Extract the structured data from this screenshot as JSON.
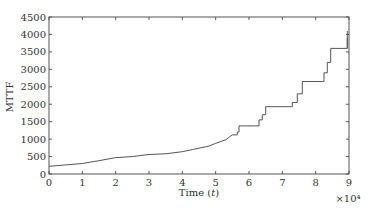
{
  "chart_data": {
    "type": "line",
    "title": "",
    "xlabel": "Time (t)",
    "ylabel": "MTTF",
    "x_multiplier_label": "×10⁴",
    "xlim": [
      0,
      9
    ],
    "ylim": [
      0,
      4500
    ],
    "x_ticks": [
      0,
      1,
      2,
      3,
      4,
      5,
      6,
      7,
      8,
      9
    ],
    "y_ticks": [
      0,
      500,
      1000,
      1500,
      2000,
      2500,
      3000,
      3500,
      4000,
      4500
    ],
    "grid": false,
    "legend": null,
    "line_color": "#555555",
    "series": [
      {
        "name": "MTTF",
        "step": true,
        "x": [
          0,
          0.5,
          1.0,
          1.5,
          2.0,
          2.5,
          3.0,
          3.5,
          4.0,
          4.3,
          4.5,
          4.8,
          5.0,
          5.3,
          5.5,
          5.65,
          5.7,
          6.2,
          6.3,
          6.4,
          6.5,
          7.2,
          7.3,
          7.45,
          7.6,
          8.2,
          8.25,
          8.35,
          8.45,
          8.85,
          8.95
        ],
        "y": [
          220,
          260,
          300,
          380,
          470,
          500,
          560,
          580,
          640,
          700,
          740,
          800,
          880,
          980,
          1120,
          1200,
          1380,
          1380,
          1550,
          1700,
          1930,
          1930,
          2050,
          2300,
          2650,
          2650,
          2900,
          3200,
          3600,
          3600,
          4100
        ]
      }
    ]
  }
}
